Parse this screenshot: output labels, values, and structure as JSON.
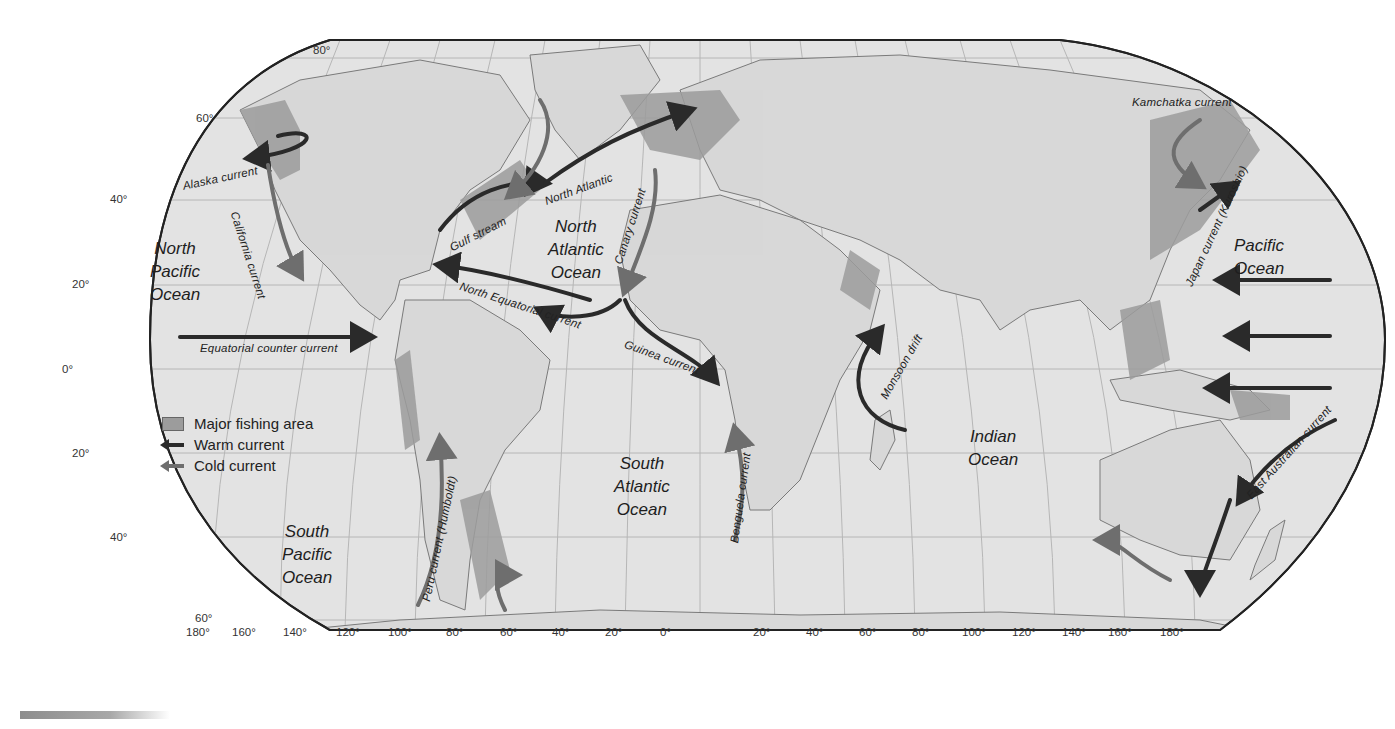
{
  "map": {
    "type": "world ocean currents and fishing areas",
    "projection": "Robinson",
    "colors": {
      "background": "#ffffff",
      "ocean": "#e3e3e3",
      "land": "#d8d8d8",
      "fishing_area": "#9c9c9c",
      "warm_current": "#2a2a2a",
      "cold_current": "#6e6e6e",
      "graticule": "#b6b6b6",
      "outline": "#222222"
    }
  },
  "legend": {
    "items": [
      {
        "icon": "fishing-area-swatch",
        "label": "Major fishing area"
      },
      {
        "icon": "warm-current-arrow",
        "label": "Warm current"
      },
      {
        "icon": "cold-current-arrow",
        "label": "Cold current"
      }
    ]
  },
  "oceans": [
    {
      "name": "north-pacific",
      "lines": [
        "North",
        "Pacific",
        "Ocean"
      ]
    },
    {
      "name": "north-atlantic",
      "lines": [
        "North",
        "Atlantic",
        "Ocean"
      ]
    },
    {
      "name": "south-atlantic",
      "lines": [
        "South",
        "Atlantic",
        "Ocean"
      ]
    },
    {
      "name": "south-pacific",
      "lines": [
        "South",
        "Pacific",
        "Ocean"
      ]
    },
    {
      "name": "indian",
      "lines": [
        "Indian",
        "Ocean"
      ]
    },
    {
      "name": "pacific-east",
      "lines": [
        "Pacific",
        "Ocean"
      ]
    }
  ],
  "currents": [
    {
      "name": "Alaska current",
      "type": "warm"
    },
    {
      "name": "California current",
      "type": "cold"
    },
    {
      "name": "Gulf stream",
      "type": "warm"
    },
    {
      "name": "North Atlantic",
      "type": "warm"
    },
    {
      "name": "Canary current",
      "type": "cold"
    },
    {
      "name": "North Equatorial current",
      "type": "warm"
    },
    {
      "name": "Equatorial counter current",
      "type": "warm"
    },
    {
      "name": "Guinea current",
      "type": "warm"
    },
    {
      "name": "Peru current (Humboldt)",
      "type": "cold"
    },
    {
      "name": "Benguela current",
      "type": "cold"
    },
    {
      "name": "Monsoon drift",
      "type": "warm"
    },
    {
      "name": "Kamchatka current",
      "type": "cold"
    },
    {
      "name": "Japan current (Kuroshio)",
      "type": "warm"
    },
    {
      "name": "East Australian current",
      "type": "warm"
    }
  ],
  "latitude_labels": {
    "north": [
      "80°",
      "60°",
      "40°",
      "20°"
    ],
    "equator": "0°",
    "south": [
      "20°",
      "40°",
      "60°"
    ]
  },
  "longitude_labels": [
    "180°",
    "160°",
    "140°",
    "120°",
    "100°",
    "80°",
    "60°",
    "40°",
    "20°",
    "0°",
    "20°",
    "40°",
    "60°",
    "80°",
    "100°",
    "120°",
    "140°",
    "160°",
    "180°"
  ]
}
